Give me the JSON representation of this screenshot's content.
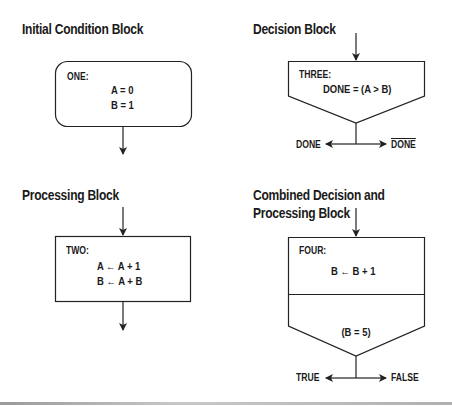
{
  "diagram": {
    "initial_condition": {
      "title": "Initial Condition Block",
      "label": "ONE:",
      "lines": [
        "A = 0",
        "B = 1"
      ]
    },
    "decision": {
      "title": "Decision Block",
      "label": "THREE:",
      "expression": "DONE = (A > B)",
      "left_branch": "DONE",
      "right_branch": "DONE",
      "right_branch_negated": true
    },
    "processing": {
      "title": "Processing Block",
      "label": "TWO:",
      "lines": [
        "A ← A + 1",
        "B ← A + B"
      ]
    },
    "combined": {
      "title_line1": "Combined Decision and",
      "title_line2": "Processing Block",
      "label": "FOUR:",
      "process_line": "B ← B + 1",
      "condition": "(B = 5)",
      "left_branch": "TRUE",
      "right_branch": "FALSE"
    }
  },
  "colors": {
    "stroke": "#222222",
    "text": "#1a1a1a",
    "background": "#ffffff"
  }
}
